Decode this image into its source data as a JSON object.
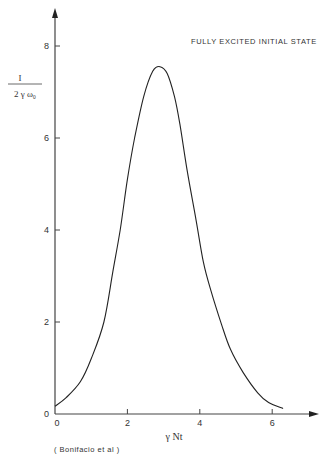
{
  "chart_data": {
    "type": "line",
    "title": "FULLY EXCITED INITIAL STATE",
    "xlabel": "γ Nt",
    "ylabel_numerator": "I",
    "ylabel_denominator": "2 γ ω₀",
    "ylabel": "I / (2 γ ω₀)",
    "annotation": "( Bonifacio et al )",
    "xlim": [
      0,
      7
    ],
    "ylim": [
      0,
      8.5
    ],
    "x_ticks": [
      0,
      2,
      4,
      6
    ],
    "y_ticks": [
      0,
      2,
      4,
      6,
      8
    ],
    "x_tick_labels": [
      "0",
      "2",
      "4",
      "6"
    ],
    "y_tick_labels": [
      "0",
      "2",
      "4",
      "6",
      "8"
    ],
    "grid": false,
    "legend": null,
    "series": [
      {
        "name": "Superradiant pulse intensity",
        "x": [
          0.0,
          0.3,
          0.7,
          1.0,
          1.35,
          1.6,
          1.8,
          2.0,
          2.2,
          2.45,
          2.7,
          2.9,
          3.1,
          3.3,
          3.45,
          3.65,
          3.9,
          4.1,
          4.3,
          4.6,
          4.85,
          5.2,
          5.6,
          5.9,
          6.3
        ],
        "y": [
          0.17,
          0.35,
          0.7,
          1.2,
          2.0,
          3.1,
          4.0,
          5.1,
          6.0,
          6.9,
          7.45,
          7.55,
          7.4,
          6.9,
          6.3,
          5.3,
          4.2,
          3.3,
          2.7,
          1.95,
          1.4,
          0.9,
          0.46,
          0.25,
          0.12
        ]
      }
    ]
  }
}
